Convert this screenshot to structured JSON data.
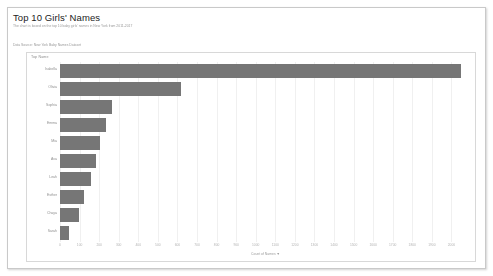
{
  "dashboard": {
    "title": "Top 10 Girls' Names",
    "subtitle": "The chart is based on the top 10 baby girls' names in New York from 2011-2017",
    "caption": "Data Source: New York Baby Names Dataset"
  },
  "panel": {
    "header_label": "Top Name"
  },
  "chart_data": {
    "type": "bar",
    "orientation": "horizontal",
    "title": "Top 10 Girls' Names",
    "xlabel": "Count of Names",
    "ylabel": "Top Name",
    "xlim": [
      0,
      2100
    ],
    "grid": true,
    "legend": false,
    "bar_color": "#767676",
    "sort": "descending",
    "axis_sort_indicator": "▼",
    "categories": [
      "Isabella",
      "Olivia",
      "Sophia",
      "Emma",
      "Mia",
      "Ava",
      "Leah",
      "Esther",
      "Chaya",
      "Sarah"
    ],
    "values": [
      2050,
      620,
      265,
      235,
      205,
      185,
      160,
      125,
      95,
      45
    ],
    "xticks": [
      "0",
      "100",
      "200",
      "300",
      "400",
      "500",
      "600",
      "700",
      "800",
      "900",
      "1000",
      "1100",
      "1200",
      "1300",
      "1400",
      "1500",
      "1600",
      "1700",
      "1800",
      "1900",
      "2000"
    ]
  }
}
